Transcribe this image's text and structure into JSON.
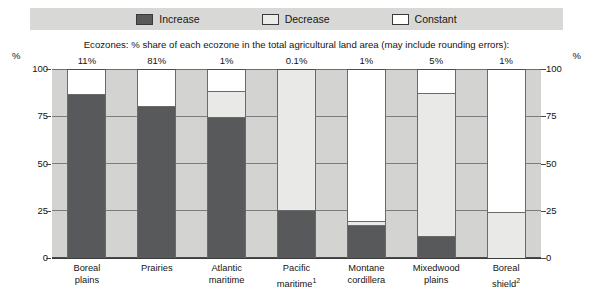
{
  "legend": {
    "items": [
      {
        "label": "Increase",
        "key": "increase",
        "color": "#58595B"
      },
      {
        "label": "Decrease",
        "key": "decrease",
        "color": "#E9E9E7"
      },
      {
        "label": "Constant",
        "key": "constant",
        "color": "#FFFFFF"
      }
    ]
  },
  "subtitle": "Ecozones: % share of each ecozone in the total agricultural land area (may include rounding errors):",
  "axis": {
    "unit_left": "%",
    "unit_right": "%",
    "ticks": [
      "100",
      "75",
      "50",
      "25",
      "0"
    ]
  },
  "chart_data": {
    "type": "bar",
    "title": "",
    "subtitle": "Ecozones: % share of each ecozone in the total agricultural land area (may include rounding errors):",
    "xlabel": "",
    "ylabel": "%",
    "ylim": [
      0,
      100
    ],
    "yticks": [
      0,
      25,
      50,
      75,
      100
    ],
    "grid": true,
    "stacked": true,
    "legend_position": "top",
    "categories": [
      "Boreal plains",
      "Prairies",
      "Atlantic maritime",
      "Pacific maritime",
      "Montane cordillera",
      "Mixedwood plains",
      "Boreal shield"
    ],
    "category_labels": [
      {
        "line1": "Boreal",
        "line2": "plains",
        "note": ""
      },
      {
        "line1": "Prairies",
        "line2": "",
        "note": ""
      },
      {
        "line1": "Atlantic",
        "line2": "maritime",
        "note": ""
      },
      {
        "line1": "Pacific",
        "line2": "maritime",
        "note": "1"
      },
      {
        "line1": "Montane",
        "line2": "cordillera",
        "note": ""
      },
      {
        "line1": "Mixedwood",
        "line2": "plains",
        "note": ""
      },
      {
        "line1": "Boreal",
        "line2": "shield",
        "note": "2"
      }
    ],
    "share_labels": [
      "11%",
      "81%",
      "1%",
      "0.1%",
      "1%",
      "5%",
      "1%"
    ],
    "series": [
      {
        "name": "Increase",
        "values": [
          86,
          80,
          74,
          25,
          17,
          11,
          0
        ]
      },
      {
        "name": "Decrease",
        "values": [
          0,
          0,
          14,
          75,
          2,
          76,
          24
        ]
      },
      {
        "name": "Constant",
        "values": [
          14,
          20,
          12,
          0,
          81,
          13,
          76
        ]
      }
    ]
  }
}
